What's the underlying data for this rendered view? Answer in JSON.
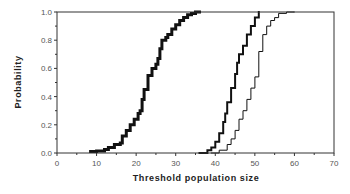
{
  "chart_data": {
    "type": "line",
    "title": "",
    "xlabel": "Threshold  population  size",
    "ylabel": "Probability",
    "xlim": [
      0,
      70
    ],
    "ylim": [
      0.0,
      1.0
    ],
    "xticks": [
      "0",
      "10",
      "20",
      "30",
      "40",
      "50",
      "60",
      "70"
    ],
    "yticks": [
      "0.0",
      "0.2",
      "0.4",
      "0.6",
      "0.8",
      "1.0"
    ],
    "grid": false,
    "legend": null,
    "step": true,
    "series": [
      {
        "name": "curve-1 (thick, left)",
        "style": "thick",
        "x": [
          8.5,
          10,
          12,
          13,
          14.5,
          16,
          16.5,
          17.5,
          18.5,
          19.5,
          20.5,
          21,
          21.5,
          22,
          23,
          24,
          25,
          25.5,
          26,
          26.5,
          27.5,
          28,
          29,
          30,
          31,
          32,
          33,
          34,
          35,
          36
        ],
        "y": [
          0.01,
          0.015,
          0.025,
          0.04,
          0.06,
          0.07,
          0.12,
          0.16,
          0.2,
          0.24,
          0.28,
          0.3,
          0.38,
          0.45,
          0.55,
          0.6,
          0.63,
          0.67,
          0.74,
          0.8,
          0.82,
          0.84,
          0.88,
          0.91,
          0.94,
          0.96,
          0.98,
          0.99,
          1.0,
          1.0
        ]
      },
      {
        "name": "curve-2 (medium, middle)",
        "style": "medium",
        "x": [
          36,
          38,
          39,
          40,
          41,
          42,
          42.5,
          43,
          44,
          45,
          45.5,
          46,
          47,
          48,
          49,
          50,
          51
        ],
        "y": [
          0.0,
          0.02,
          0.04,
          0.08,
          0.14,
          0.22,
          0.28,
          0.36,
          0.46,
          0.56,
          0.64,
          0.7,
          0.76,
          0.84,
          0.9,
          0.96,
          1.0
        ]
      },
      {
        "name": "curve-3 (thin, right)",
        "style": "thin",
        "x": [
          39,
          41,
          43,
          44,
          45,
          46,
          47,
          48,
          49,
          50,
          51,
          52,
          53,
          54,
          55,
          56,
          58,
          60
        ],
        "y": [
          0.0,
          0.02,
          0.06,
          0.1,
          0.16,
          0.24,
          0.3,
          0.38,
          0.46,
          0.54,
          0.72,
          0.84,
          0.9,
          0.94,
          0.96,
          0.99,
          1.0,
          1.0
        ]
      }
    ]
  }
}
